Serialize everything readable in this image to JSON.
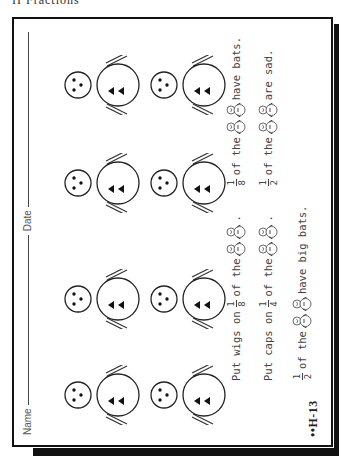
{
  "page_header": "II   Fractions",
  "worksheet": {
    "name_label": "Name",
    "date_label": "Date",
    "page_code": "••H-13",
    "snowmen": {
      "rows": 2,
      "columns": 4,
      "count": 8,
      "description": "Snowman with head (3 dots face) and body (2 triangle buttons), stick arms"
    },
    "sentences": [
      {
        "parts": [
          {
            "t": "text",
            "v": "Put wigs on"
          },
          {
            "t": "frac",
            "n": "1",
            "d": "8"
          },
          {
            "t": "text",
            "v": "of the"
          },
          {
            "t": "icon",
            "v": "small-snowman"
          },
          {
            "t": "icon",
            "v": "small-snowman"
          },
          {
            "t": "text",
            "v": "."
          },
          {
            "t": "gap"
          },
          {
            "t": "frac",
            "n": "1",
            "d": "8"
          },
          {
            "t": "text",
            "v": "of the"
          },
          {
            "t": "icon",
            "v": "small-snowman"
          },
          {
            "t": "icon",
            "v": "small-snowman"
          },
          {
            "t": "text",
            "v": "have bats."
          }
        ]
      },
      {
        "parts": [
          {
            "t": "text",
            "v": "Put caps on"
          },
          {
            "t": "frac",
            "n": "1",
            "d": "4"
          },
          {
            "t": "text",
            "v": "of the"
          },
          {
            "t": "icon",
            "v": "small-snowman"
          },
          {
            "t": "icon",
            "v": "small-snowman"
          },
          {
            "t": "text",
            "v": "."
          },
          {
            "t": "gap"
          },
          {
            "t": "frac",
            "n": "1",
            "d": "2"
          },
          {
            "t": "text",
            "v": "of the"
          },
          {
            "t": "icon",
            "v": "small-snowman"
          },
          {
            "t": "icon",
            "v": "small-snowman"
          },
          {
            "t": "text",
            "v": "are sad."
          }
        ]
      },
      {
        "parts": [
          {
            "t": "frac",
            "n": "1",
            "d": "2"
          },
          {
            "t": "text",
            "v": "of the"
          },
          {
            "t": "icon",
            "v": "small-snowman"
          },
          {
            "t": "icon",
            "v": "small-snowman"
          },
          {
            "t": "text",
            "v": "have big bats."
          }
        ]
      }
    ]
  }
}
